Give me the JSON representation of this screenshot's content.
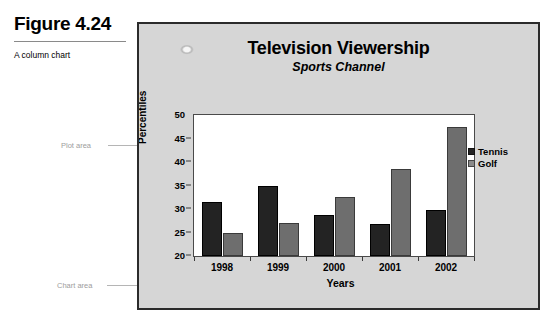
{
  "figure": {
    "number": "Figure 4.24",
    "description": "A column chart"
  },
  "callouts": {
    "plot_area": "Plot area",
    "chart_area": "Chart area"
  },
  "legend": {
    "position": "right",
    "entries": [
      {
        "label": "Tennis",
        "color": "#232323"
      },
      {
        "label": "Golf",
        "color": "#8a8a8a"
      }
    ]
  },
  "chart_data": {
    "type": "bar",
    "title": "Television Viewership",
    "subtitle": "Sports Channel",
    "xlabel": "Years",
    "ylabel": "Percentiles",
    "categories": [
      "1998",
      "1999",
      "2000",
      "2001",
      "2002"
    ],
    "series": [
      {
        "name": "Tennis",
        "color": "#232323",
        "values": [
          31.5,
          35.0,
          28.8,
          26.8,
          29.7
        ]
      },
      {
        "name": "Golf",
        "color": "#6e6e6e",
        "values": [
          25.0,
          27.0,
          32.5,
          38.5,
          47.5
        ]
      }
    ],
    "ylim": [
      20,
      50
    ],
    "yticks": [
      20,
      25,
      30,
      35,
      40,
      45,
      50
    ],
    "grid": false,
    "legend_position": "right"
  }
}
